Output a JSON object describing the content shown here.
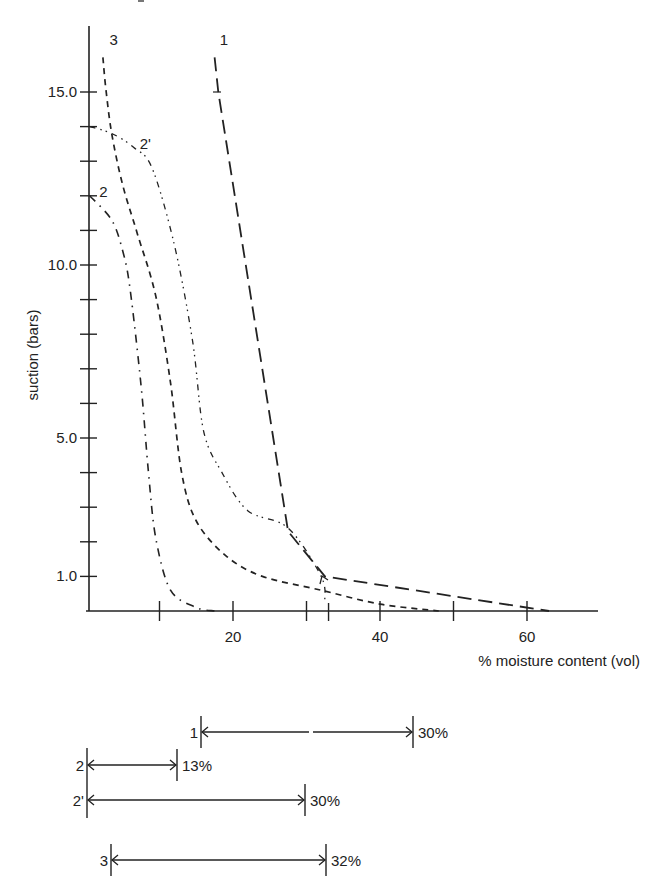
{
  "chart_data": {
    "type": "line",
    "title": "",
    "xlabel": "% moisture content (vol)",
    "ylabel": "suction (bars)",
    "xlim": [
      0,
      70
    ],
    "ylim": [
      0,
      17
    ],
    "x_ticks": [
      10,
      20,
      30,
      33,
      40,
      50,
      60
    ],
    "x_tick_labels": [
      {
        "value": 20,
        "label": "20"
      },
      {
        "value": 40,
        "label": "40"
      },
      {
        "value": 60,
        "label": "60"
      }
    ],
    "y_ticks": [
      1,
      2,
      3,
      4,
      5,
      6,
      7,
      8,
      9,
      10,
      11,
      12,
      13,
      14,
      15
    ],
    "y_tick_labels": [
      {
        "value": 1,
        "label": "1.0"
      },
      {
        "value": 5,
        "label": "5.0"
      },
      {
        "value": 10,
        "label": "10.0"
      },
      {
        "value": 15,
        "label": "15.0"
      }
    ],
    "grid": false,
    "legend": "inline curve labels",
    "series": [
      {
        "name": "1",
        "line_style": "long-dash",
        "label_pos": [
          18.2,
          16.5
        ],
        "points": [
          [
            17.5,
            16.0
          ],
          [
            18.0,
            15.0
          ],
          [
            27.5,
            2.3
          ],
          [
            32.5,
            1.0
          ],
          [
            63.0,
            0.0
          ]
        ]
      },
      {
        "name": "2",
        "line_style": "dash-dot",
        "label_pos": [
          1.8,
          12.1
        ],
        "points": [
          [
            0.5,
            12.0
          ],
          [
            3.5,
            11.3
          ],
          [
            5.0,
            10.4
          ],
          [
            6.0,
            9.3
          ],
          [
            7.5,
            6.5
          ],
          [
            8.5,
            4.0
          ],
          [
            9.5,
            2.1
          ],
          [
            11.5,
            0.6
          ],
          [
            15.0,
            0.1
          ],
          [
            17.5,
            0.0
          ]
        ]
      },
      {
        "name": "2'",
        "line_style": "dash-dot-dot",
        "label_pos": [
          7.3,
          13.5
        ],
        "points": [
          [
            0.5,
            14.0
          ],
          [
            3.5,
            13.8
          ],
          [
            6.5,
            13.4
          ],
          [
            9.0,
            12.8
          ],
          [
            12.0,
            10.6
          ],
          [
            14.5,
            7.8
          ],
          [
            16.0,
            5.2
          ],
          [
            18.5,
            4.0
          ],
          [
            22.0,
            2.9
          ],
          [
            27.5,
            2.4
          ],
          [
            32.0,
            1.0
          ],
          [
            32.5,
            0.3
          ]
        ]
      },
      {
        "name": "3",
        "line_style": "short-dash",
        "label_pos": [
          3.2,
          16.5
        ],
        "points": [
          [
            2.3,
            16.0
          ],
          [
            2.7,
            15.1
          ],
          [
            3.5,
            13.8
          ],
          [
            5.0,
            12.3
          ],
          [
            7.0,
            10.9
          ],
          [
            9.5,
            9.1
          ],
          [
            11.5,
            6.6
          ],
          [
            13.0,
            4.0
          ],
          [
            15.0,
            2.6
          ],
          [
            19.0,
            1.6
          ],
          [
            24.0,
            1.0
          ],
          [
            32.0,
            0.6
          ],
          [
            40.0,
            0.2
          ],
          [
            48.0,
            0.0
          ]
        ]
      }
    ],
    "available_water_ranges": [
      {
        "curve": "1",
        "label": "1",
        "value": "30%",
        "x_start_px": 201,
        "x_end_px": 413,
        "y_px": 732,
        "gap": true
      },
      {
        "curve": "2",
        "label": "2",
        "value": "13%",
        "x_start_px": 87,
        "x_end_px": 177,
        "y_px": 765,
        "gap": false
      },
      {
        "curve": "2'",
        "label": "2'",
        "value": "30%",
        "x_start_px": 87,
        "x_end_px": 305,
        "y_px": 800,
        "gap": false
      },
      {
        "curve": "3",
        "label": "3",
        "value": "32%",
        "x_start_px": 111,
        "x_end_px": 326,
        "y_px": 860,
        "gap": false
      }
    ]
  },
  "colors": {
    "ink": "#222222",
    "background": "#ffffff"
  }
}
